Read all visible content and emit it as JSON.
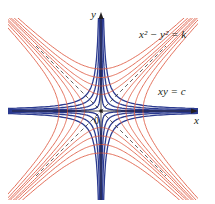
{
  "figure": {
    "labels": {
      "y_axis": "y",
      "x_axis": "x",
      "origin": "0",
      "family_red": "x² − y² = k",
      "family_blue": "xy = c"
    },
    "colors": {
      "blue_family": "#2b3a8f",
      "red_family": "#e0614a",
      "axes": "#231f20",
      "asymptotes": "#231f20"
    },
    "geometry": {
      "origin_px": [
        101,
        111
      ],
      "curves_per_family_side": 4
    }
  }
}
